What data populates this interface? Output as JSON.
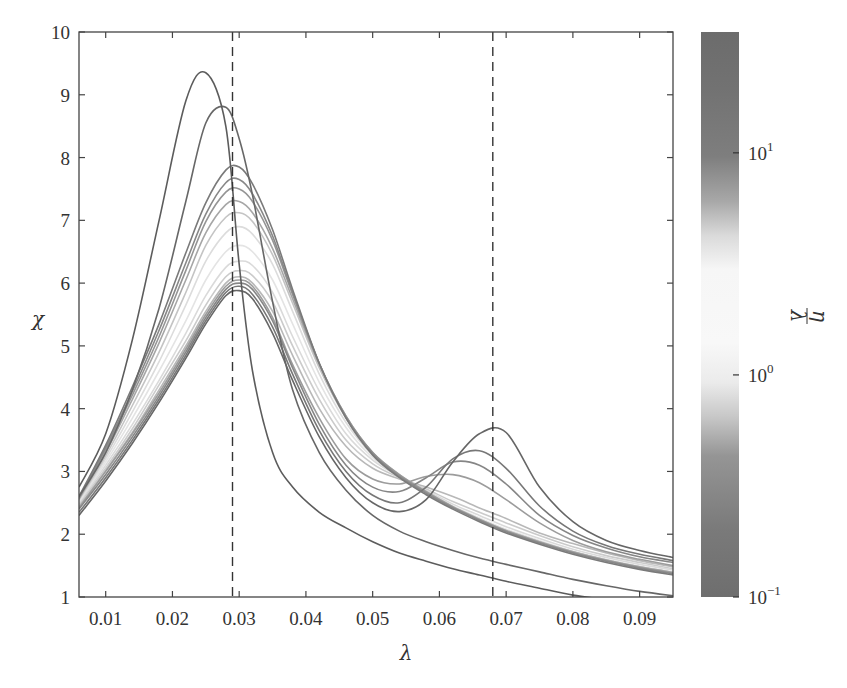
{
  "chart_data": {
    "type": "line",
    "title": "",
    "xlabel": "λ",
    "ylabel": "χ",
    "xlim": [
      0.006,
      0.095
    ],
    "ylim": [
      1,
      10
    ],
    "grid": false,
    "xticks": [
      0.01,
      0.02,
      0.03,
      0.04,
      0.05,
      0.06,
      0.07,
      0.08,
      0.09
    ],
    "xtick_labels": [
      "0.01",
      "0.02",
      "0.03",
      "0.04",
      "0.05",
      "0.06",
      "0.07",
      "0.08",
      "0.09"
    ],
    "yticks": [
      1,
      2,
      3,
      4,
      5,
      6,
      7,
      8,
      9,
      10
    ],
    "ytick_labels": [
      "1",
      "2",
      "3",
      "4",
      "5",
      "6",
      "7",
      "8",
      "9",
      "10"
    ],
    "vlines": [
      {
        "x": 0.029,
        "style": "dashed"
      },
      {
        "x": 0.068,
        "style": "dashed"
      }
    ],
    "colorbar": {
      "label": "η/λ",
      "label_num": "η",
      "label_den": "λ",
      "scale": "log",
      "range": [
        0.1,
        35
      ],
      "ticks": [
        {
          "value": 10,
          "label_base": "10",
          "label_exp": "1"
        },
        {
          "value": 1,
          "label_base": "10",
          "label_exp": "0"
        },
        {
          "value": 0.1,
          "label_base": "10",
          "label_exp": "−1"
        }
      ],
      "gradient_stops": [
        {
          "offset": 0.0,
          "color": "#6c6c6c"
        },
        {
          "offset": 0.1,
          "color": "#727272"
        },
        {
          "offset": 0.22,
          "color": "#7e7e7e"
        },
        {
          "offset": 0.3,
          "color": "#a8a8a8"
        },
        {
          "offset": 0.36,
          "color": "#dadada"
        },
        {
          "offset": 0.42,
          "color": "#f6f6f6"
        },
        {
          "offset": 0.55,
          "color": "#f8f8f8"
        },
        {
          "offset": 0.62,
          "color": "#ebebeb"
        },
        {
          "offset": 0.68,
          "color": "#c8c8c8"
        },
        {
          "offset": 0.75,
          "color": "#959595"
        },
        {
          "offset": 0.88,
          "color": "#7a7a7a"
        },
        {
          "offset": 1.0,
          "color": "#6e6e6e"
        }
      ]
    },
    "x": [
      0.006,
      0.01,
      0.014,
      0.018,
      0.022,
      0.025,
      0.028,
      0.03,
      0.032,
      0.035,
      0.038,
      0.042,
      0.046,
      0.05,
      0.054,
      0.058,
      0.062,
      0.066,
      0.07,
      0.075,
      0.08,
      0.085,
      0.09,
      0.095
    ],
    "series": [
      {
        "name": "η/λ=0.5",
        "eta_over_lambda": 0.5,
        "color": "#b8b8b8",
        "values": [
          2.45,
          3.02,
          3.62,
          4.3,
          5.0,
          5.55,
          6.0,
          6.1,
          6.0,
          5.55,
          4.85,
          4.0,
          3.4,
          3.05,
          2.88,
          2.75,
          2.6,
          2.42,
          2.25,
          2.02,
          1.85,
          1.7,
          1.58,
          1.48
        ]
      },
      {
        "name": "η/λ=0.8",
        "eta_over_lambda": 0.8,
        "color": "#cbcbcb",
        "values": [
          2.48,
          3.05,
          3.68,
          4.38,
          5.08,
          5.65,
          6.1,
          6.2,
          6.12,
          5.7,
          5.0,
          4.15,
          3.5,
          3.12,
          2.9,
          2.72,
          2.52,
          2.35,
          2.18,
          1.98,
          1.8,
          1.66,
          1.55,
          1.45
        ]
      },
      {
        "name": "η/λ=1.2",
        "eta_over_lambda": 1.2,
        "color": "#dadada",
        "values": [
          2.5,
          3.1,
          3.75,
          4.45,
          5.2,
          5.8,
          6.25,
          6.35,
          6.28,
          5.85,
          5.15,
          4.28,
          3.6,
          3.18,
          2.92,
          2.7,
          2.48,
          2.3,
          2.12,
          1.93,
          1.76,
          1.63,
          1.52,
          1.43
        ]
      },
      {
        "name": "η/λ=2",
        "eta_over_lambda": 2,
        "color": "#e4e4e4",
        "values": [
          2.52,
          3.15,
          3.85,
          4.6,
          5.4,
          6.05,
          6.5,
          6.6,
          6.5,
          6.05,
          5.35,
          4.42,
          3.7,
          3.22,
          2.93,
          2.68,
          2.45,
          2.26,
          2.08,
          1.9,
          1.73,
          1.6,
          1.49,
          1.4
        ]
      },
      {
        "name": "η/λ=3",
        "eta_over_lambda": 3,
        "color": "#dcdcdc",
        "values": [
          2.54,
          3.2,
          3.95,
          4.75,
          5.65,
          6.35,
          6.8,
          6.9,
          6.78,
          6.3,
          5.55,
          4.55,
          3.78,
          3.26,
          2.94,
          2.68,
          2.44,
          2.24,
          2.06,
          1.88,
          1.72,
          1.59,
          1.48,
          1.39
        ]
      },
      {
        "name": "η/λ=5",
        "eta_over_lambda": 5,
        "color": "#c4c4c4",
        "values": [
          2.55,
          3.25,
          4.05,
          4.9,
          5.85,
          6.6,
          7.05,
          7.12,
          6.98,
          6.45,
          5.68,
          4.65,
          3.85,
          3.3,
          2.95,
          2.68,
          2.44,
          2.24,
          2.06,
          1.88,
          1.72,
          1.59,
          1.48,
          1.39
        ]
      },
      {
        "name": "η/λ=0.3",
        "eta_over_lambda": 0.3,
        "color": "#9c9c9c",
        "values": [
          2.42,
          3.0,
          3.6,
          4.25,
          4.95,
          5.5,
          5.95,
          6.05,
          5.95,
          5.45,
          4.7,
          3.85,
          3.2,
          2.88,
          2.8,
          2.92,
          2.95,
          2.82,
          2.55,
          2.18,
          1.9,
          1.72,
          1.6,
          1.5
        ]
      },
      {
        "name": "η/λ=8",
        "eta_over_lambda": 8,
        "color": "#a6a6a6",
        "values": [
          2.56,
          3.3,
          4.15,
          5.05,
          6.05,
          6.8,
          7.25,
          7.3,
          7.12,
          6.55,
          5.75,
          4.7,
          3.88,
          3.3,
          2.95,
          2.68,
          2.44,
          2.24,
          2.06,
          1.88,
          1.72,
          1.59,
          1.48,
          1.39
        ]
      },
      {
        "name": "η/λ=10",
        "eta_over_lambda": 10,
        "color": "#959595",
        "values": [
          2.57,
          3.35,
          4.22,
          5.15,
          6.2,
          6.98,
          7.45,
          7.5,
          7.3,
          6.68,
          5.82,
          4.72,
          3.88,
          3.3,
          2.94,
          2.67,
          2.43,
          2.23,
          2.05,
          1.87,
          1.71,
          1.58,
          1.47,
          1.38
        ]
      },
      {
        "name": "η/λ=12",
        "eta_over_lambda": 12,
        "color": "#888888",
        "values": [
          2.58,
          3.38,
          4.28,
          5.25,
          6.32,
          7.1,
          7.6,
          7.65,
          7.42,
          6.75,
          5.85,
          4.72,
          3.86,
          3.28,
          2.92,
          2.65,
          2.42,
          2.22,
          2.04,
          1.86,
          1.7,
          1.57,
          1.46,
          1.37
        ]
      },
      {
        "name": "η/λ=15",
        "eta_over_lambda": 15,
        "color": "#7a7a7a",
        "values": [
          2.6,
          3.42,
          4.35,
          5.35,
          6.48,
          7.28,
          7.8,
          7.85,
          7.58,
          6.85,
          5.9,
          4.72,
          3.85,
          3.26,
          2.9,
          2.63,
          2.4,
          2.2,
          2.02,
          1.84,
          1.68,
          1.55,
          1.44,
          1.35
        ]
      },
      {
        "name": "η/λ=0.2",
        "eta_over_lambda": 0.2,
        "color": "#868686",
        "values": [
          2.4,
          2.95,
          3.55,
          4.2,
          4.9,
          5.45,
          5.9,
          6.0,
          5.9,
          5.4,
          4.65,
          3.75,
          3.1,
          2.75,
          2.68,
          2.9,
          3.15,
          3.1,
          2.8,
          2.3,
          1.98,
          1.78,
          1.64,
          1.55
        ]
      },
      {
        "name": "η/λ=0.15",
        "eta_over_lambda": 0.15,
        "color": "#777777",
        "values": [
          2.35,
          2.9,
          3.5,
          4.15,
          4.85,
          5.4,
          5.85,
          5.95,
          5.82,
          5.3,
          4.55,
          3.65,
          3.0,
          2.62,
          2.5,
          2.75,
          3.2,
          3.33,
          3.05,
          2.45,
          2.05,
          1.82,
          1.68,
          1.58
        ]
      },
      {
        "name": "η/λ=0.1",
        "eta_over_lambda": 0.1,
        "color": "#666666",
        "values": [
          2.3,
          2.85,
          3.45,
          4.1,
          4.8,
          5.35,
          5.8,
          5.88,
          5.75,
          5.2,
          4.45,
          3.55,
          2.9,
          2.5,
          2.36,
          2.55,
          3.15,
          3.6,
          3.62,
          2.75,
          2.2,
          1.9,
          1.74,
          1.63
        ]
      },
      {
        "name": "η/λ=20",
        "eta_over_lambda": 20,
        "color": "#676767",
        "values": [
          2.6,
          3.3,
          4.3,
          5.6,
          7.3,
          8.55,
          8.8,
          8.3,
          7.4,
          5.7,
          4.3,
          3.3,
          2.7,
          2.3,
          2.05,
          1.88,
          1.74,
          1.62,
          1.52,
          1.4,
          1.28,
          1.18,
          1.09,
          1.02
        ]
      },
      {
        "name": "η/λ=30",
        "eta_over_lambda": 30,
        "color": "#5c5c5c",
        "values": [
          2.75,
          3.6,
          5.1,
          7.0,
          8.9,
          9.35,
          8.5,
          6.3,
          4.6,
          3.3,
          2.75,
          2.35,
          2.1,
          1.88,
          1.7,
          1.57,
          1.45,
          1.35,
          1.25,
          1.14,
          1.03,
          0.96,
          0.9,
          0.85
        ]
      }
    ],
    "peaks": [
      {
        "series": "η/λ=30",
        "lambda": 0.0244,
        "chi": 9.4
      },
      {
        "series": "η/λ=20",
        "lambda": 0.0268,
        "chi": 8.85
      },
      {
        "series": "η/λ=0.1",
        "lambda": 0.068,
        "chi": 3.7
      }
    ]
  },
  "axes": {
    "xlabel": "λ",
    "ylabel": "χ"
  }
}
